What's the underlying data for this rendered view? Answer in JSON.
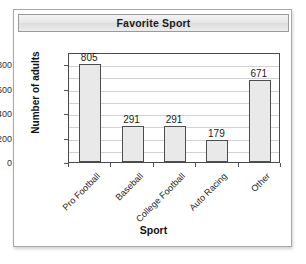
{
  "card": {
    "title": "Favorite Sport"
  },
  "chart_data": {
    "type": "bar",
    "title": "Favorite Sport",
    "xlabel": "Sport",
    "ylabel": "Number of adults",
    "categories": [
      "Pro Football",
      "Baseball",
      "College Football",
      "Auto Racing",
      "Other"
    ],
    "values": [
      805,
      291,
      291,
      179,
      671
    ],
    "value_labels": [
      "805",
      "291",
      "291",
      "179",
      "671"
    ],
    "ylim": [
      0,
      900
    ],
    "ytick_values": [
      0,
      200,
      400,
      600,
      800
    ],
    "ytick_labels": [
      "0",
      "200",
      "400",
      "600",
      "800"
    ],
    "gridline_values": [
      100,
      200,
      300,
      400,
      500,
      600,
      700,
      800
    ],
    "grid": true,
    "legend": false,
    "bar_color": "#e9e9e9",
    "bar_border_color": "#4d4d4d",
    "axis_color": "#4a4a4a",
    "grid_color": "#d2d2d2",
    "category_label_rotation": -45
  }
}
